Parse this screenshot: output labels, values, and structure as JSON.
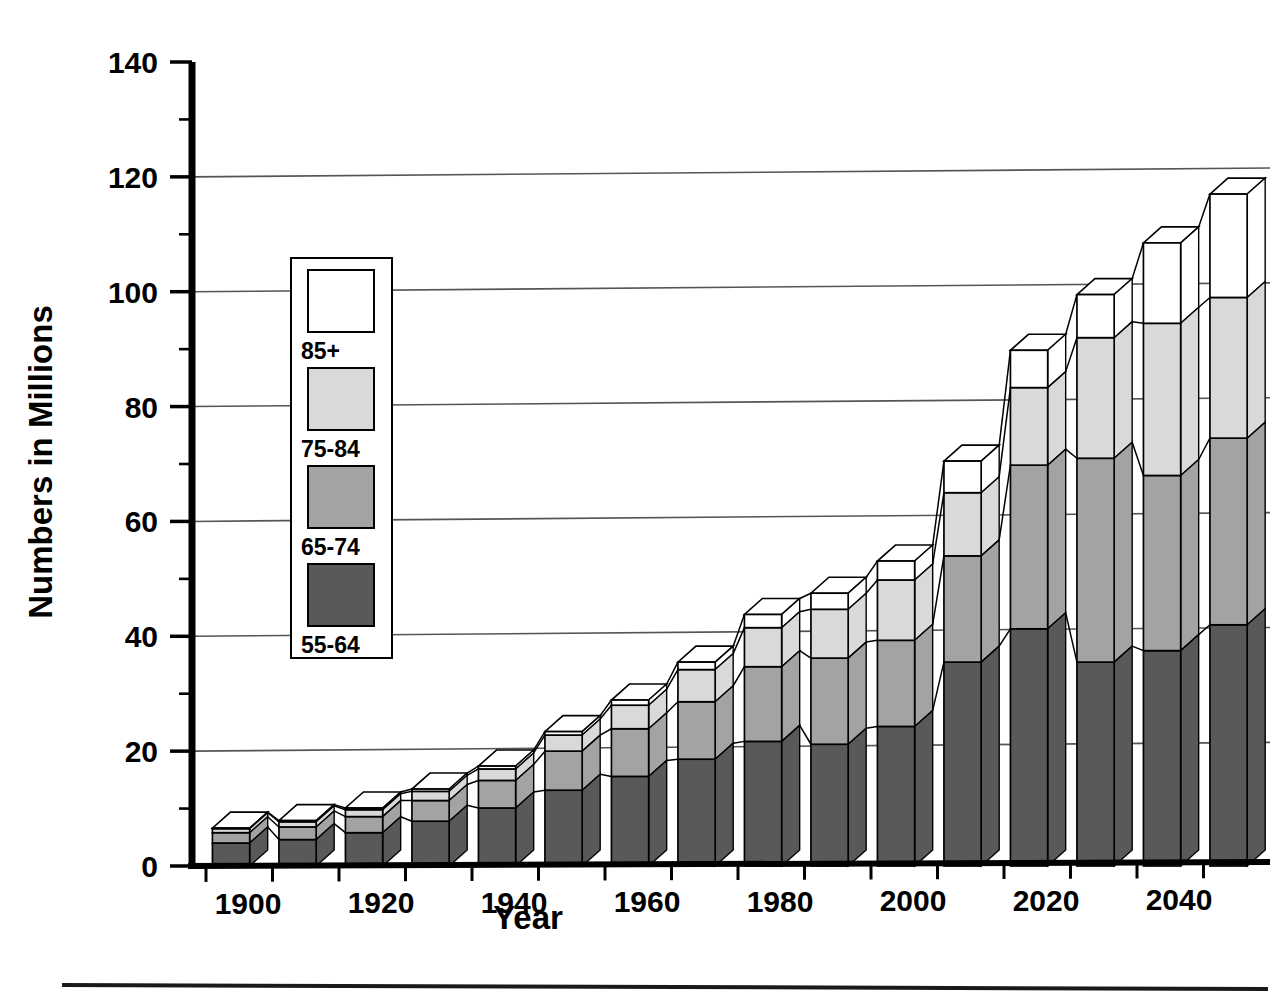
{
  "chart_data": {
    "type": "bar",
    "subtype": "stacked-bar-3d",
    "title": "",
    "xlabel": "Year",
    "ylabel": "Numbers in Millions",
    "xlim": [
      1895,
      2055
    ],
    "ylim": [
      0,
      140
    ],
    "ytick_step": 20,
    "yminor_step": 10,
    "grid": true,
    "grid_axis": "y",
    "legend_position": "inside-upper-left",
    "categories": [
      1900,
      1910,
      1920,
      1930,
      1940,
      1950,
      1960,
      1970,
      1980,
      1990,
      2000,
      2010,
      2020,
      2030,
      2040,
      2050
    ],
    "xtick_labels": [
      "1900",
      "1920",
      "1940",
      "1960",
      "1980",
      "2000",
      "2020",
      "2040"
    ],
    "xtick_values": [
      1900,
      1920,
      1940,
      1960,
      1980,
      2000,
      2020,
      2040
    ],
    "ytick_labels": [
      "0",
      "20",
      "40",
      "60",
      "80",
      "100",
      "120",
      "140"
    ],
    "ytick_values": [
      0,
      20,
      40,
      60,
      80,
      100,
      120,
      140
    ],
    "series": [
      {
        "name": "55-64",
        "color": "#595959",
        "values": [
          4.0,
          4.6,
          5.8,
          7.8,
          10.1,
          13.2,
          15.6,
          18.6,
          21.7,
          21.2,
          24.3,
          35.5,
          41.3,
          35.5,
          37.5,
          42.0
        ]
      },
      {
        "name": "65-74",
        "color": "#a3a3a3",
        "values": [
          1.8,
          2.2,
          2.8,
          3.6,
          4.8,
          6.8,
          8.3,
          10.0,
          13.0,
          15.0,
          15.0,
          18.5,
          28.5,
          35.5,
          30.5,
          32.5
        ]
      },
      {
        "name": "75-84",
        "color": "#d9d9d9",
        "values": [
          0.7,
          0.9,
          1.2,
          1.6,
          2.0,
          2.8,
          4.1,
          5.6,
          6.8,
          8.5,
          10.5,
          11.0,
          13.5,
          21.0,
          26.5,
          24.5
        ]
      },
      {
        "name": "85+",
        "color": "#ffffff",
        "values": [
          0.1,
          0.2,
          0.3,
          0.4,
          0.5,
          0.6,
          0.9,
          1.3,
          2.3,
          2.8,
          3.3,
          5.5,
          6.5,
          7.5,
          14.0,
          18.0
        ]
      }
    ],
    "totals": [
      6.6,
      7.9,
      10.1,
      13.4,
      17.4,
      23.4,
      28.9,
      35.5,
      43.8,
      47.5,
      53.1,
      70.5,
      89.8,
      99.5,
      108.5,
      117.0
    ]
  },
  "legend": {
    "entries": [
      {
        "label": "85+",
        "swatch": "white-swatch",
        "color": "#ffffff"
      },
      {
        "label": "75-84",
        "swatch": "lightgray-swatch",
        "color": "#d9d9d9"
      },
      {
        "label": "65-74",
        "swatch": "midgray-swatch",
        "color": "#a3a3a3"
      },
      {
        "label": "55-64",
        "swatch": "darkgray-swatch",
        "color": "#595959"
      }
    ]
  },
  "colors": {
    "axis": "#000000",
    "grid": "#555555",
    "outline": "#000000",
    "background": "#ffffff",
    "footer_rule": "#1a1a1a"
  }
}
